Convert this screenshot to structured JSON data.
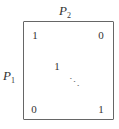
{
  "labels": {
    "top": {
      "symbol": "P",
      "subscript": "2"
    },
    "left": {
      "symbol": "P",
      "subscript": "1"
    }
  },
  "matrix": {
    "top_left": "1",
    "top_right": "0",
    "center": "1",
    "diagonal_dots": "⋱",
    "bottom_left": "0",
    "bottom_right": "1"
  }
}
